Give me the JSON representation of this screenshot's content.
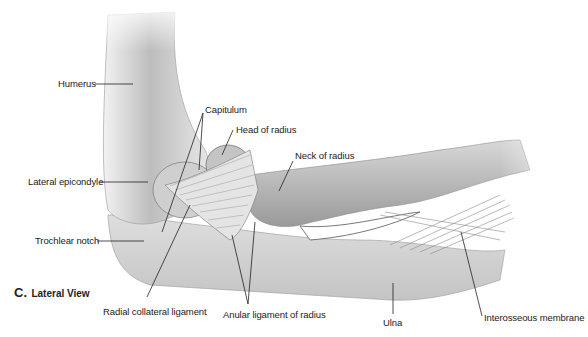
{
  "figure": {
    "title_letter": "C.",
    "title_text": "Lateral View"
  },
  "labels": {
    "humerus": "Humerus",
    "capitulum": "Capitulum",
    "head_of_radius": "Head of radius",
    "neck_of_radius": "Neck of radius",
    "lateral_epicondyle": "Lateral epicondyle",
    "trochlear_notch": "Trochlear notch",
    "radial_collateral_ligament": "Radial collateral ligament",
    "anular_ligament_of_radius": "Anular ligament of radius",
    "ulna": "Ulna",
    "interosseous_membrane": "Interosseous membrane"
  },
  "colors": {
    "bone_light": "#e9e9e9",
    "bone_mid": "#c9c9c9",
    "bone_dark": "#8a8a8a",
    "line": "#222222"
  }
}
